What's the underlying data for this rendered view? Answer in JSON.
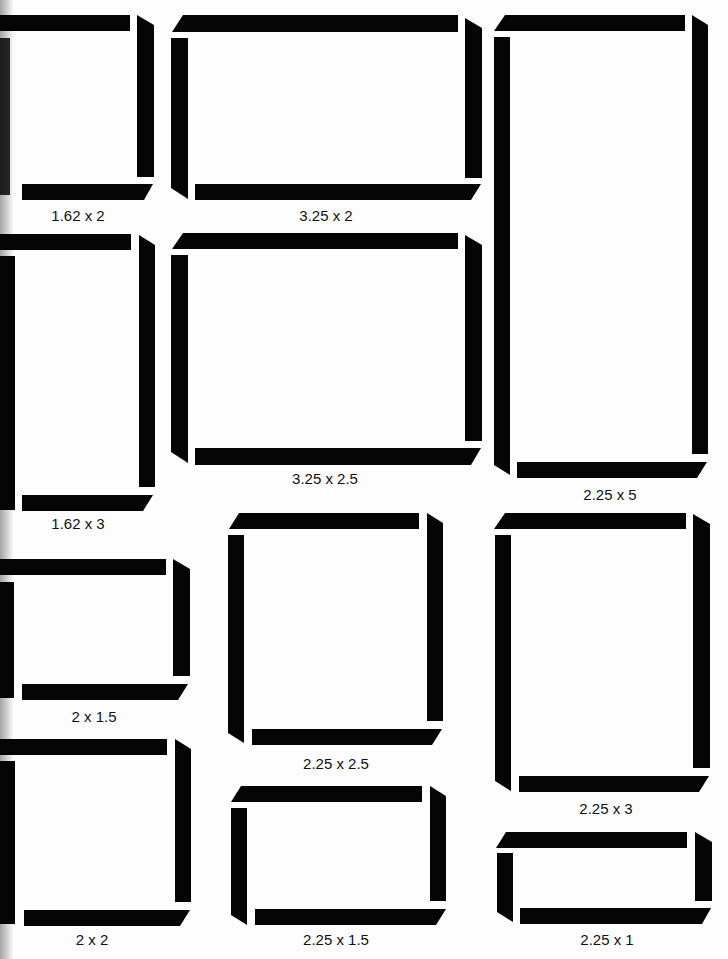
{
  "colors": {
    "bar": "#050505",
    "background": "#fdfdfd",
    "label": "#111111"
  },
  "frames": [
    {
      "id": "a",
      "label": "1.62 x 2",
      "label_pos": [
        78,
        208
      ]
    },
    {
      "id": "b",
      "label": "3.25 x 2",
      "label_pos": [
        326,
        208
      ]
    },
    {
      "id": "c",
      "label": "2.25 x 5",
      "label_pos": [
        610,
        488
      ]
    },
    {
      "id": "d",
      "label": "1.62 x 3",
      "label_pos": [
        78,
        517
      ]
    },
    {
      "id": "e",
      "label": "3.25 x 2.5",
      "label_pos": [
        325,
        472
      ]
    },
    {
      "id": "f",
      "label": "2 x 1.5",
      "label_pos": [
        94,
        710
      ]
    },
    {
      "id": "g",
      "label": "2.25 x 2.5",
      "label_pos": [
        336,
        757
      ]
    },
    {
      "id": "h",
      "label": "2.25 x 3",
      "label_pos": [
        606,
        802
      ]
    },
    {
      "id": "i",
      "label": "2 x 2",
      "label_pos": [
        92,
        933
      ]
    },
    {
      "id": "j",
      "label": "2.25 x 1.5",
      "label_pos": [
        336,
        933
      ]
    },
    {
      "id": "k",
      "label": "2.25 x 1",
      "label_pos": [
        607,
        933
      ]
    }
  ]
}
